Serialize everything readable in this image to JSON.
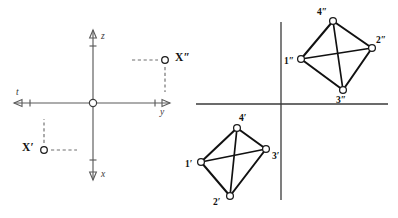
{
  "figure": {
    "width": 398,
    "height": 218,
    "background": "#ffffff",
    "ink_color": "#111111",
    "axis_color": "#5a5a5a"
  },
  "left_diagram": {
    "name": "coordinate-axes-with-points",
    "origin": {
      "x": 93,
      "y": 103
    },
    "axes": [
      {
        "id": "t",
        "label": "t",
        "direction": "left",
        "arrow": true
      },
      {
        "id": "y",
        "label": "y",
        "direction": "right",
        "arrow": true
      },
      {
        "id": "z",
        "label": "z",
        "direction": "up",
        "arrow": true
      },
      {
        "id": "x",
        "label": "x",
        "direction": "down",
        "arrow": true
      }
    ],
    "points": [
      {
        "id": "X2",
        "label": "X″",
        "x": 165,
        "y": 60,
        "label_side": "right"
      },
      {
        "id": "X1",
        "label": "X′",
        "x": 44,
        "y": 150,
        "label_side": "left"
      }
    ]
  },
  "right_diagram": {
    "name": "two-quadrilaterals-with-axes",
    "axes": {
      "horizontal": {
        "x1": 196,
        "y1": 104,
        "x2": 388,
        "y2": 104
      },
      "vertical": {
        "x1": 281,
        "y1": 22,
        "x2": 281,
        "y2": 200
      }
    },
    "upper_quad": {
      "name": "upper-quadrilateral",
      "vertices": [
        {
          "id": "v1dd",
          "label": "1″",
          "x": 301,
          "y": 59,
          "label_dx": -16,
          "label_dy": -1
        },
        {
          "id": "v2dd",
          "label": "2″",
          "x": 372,
          "y": 48,
          "label_dx": 5,
          "label_dy": -11
        },
        {
          "id": "v3dd",
          "label": "3″",
          "x": 343,
          "y": 90,
          "label_dx": -5,
          "label_dy": 8
        },
        {
          "id": "v4dd",
          "label": "4″",
          "x": 333,
          "y": 21,
          "label_dx": -14,
          "label_dy": -12
        }
      ],
      "edges": [
        [
          "v1dd",
          "v4dd"
        ],
        [
          "v4dd",
          "v2dd"
        ],
        [
          "v2dd",
          "v3dd"
        ],
        [
          "v3dd",
          "v1dd"
        ]
      ],
      "diagonals": [
        [
          "v1dd",
          "v2dd"
        ],
        [
          "v4dd",
          "v3dd"
        ]
      ]
    },
    "lower_quad": {
      "name": "lower-quadrilateral",
      "vertices": [
        {
          "id": "v1d",
          "label": "1′",
          "x": 201,
          "y": 162,
          "label_dx": -15,
          "label_dy": -1
        },
        {
          "id": "v2d",
          "label": "2′",
          "x": 230,
          "y": 196,
          "label_dx": -15,
          "label_dy": 4
        },
        {
          "id": "v3d",
          "label": "3′",
          "x": 266,
          "y": 149,
          "label_dx": 5,
          "label_dy": 6
        },
        {
          "id": "v4d",
          "label": "4′",
          "x": 237,
          "y": 128,
          "label_dx": 3,
          "label_dy": -11
        }
      ],
      "edges": [
        [
          "v1d",
          "v4d"
        ],
        [
          "v4d",
          "v3d"
        ],
        [
          "v3d",
          "v2d"
        ],
        [
          "v2d",
          "v1d"
        ]
      ],
      "diagonals": [
        [
          "v1d",
          "v3d"
        ],
        [
          "v4d",
          "v2d"
        ]
      ]
    }
  }
}
